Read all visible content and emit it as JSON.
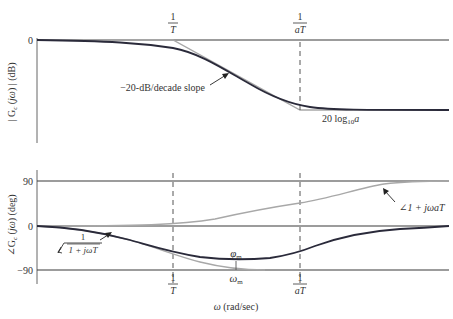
{
  "magnitude_plot": {
    "ylabel": "| G_c (jω) | (dB)",
    "ylabel_parts": {
      "pre": "| G",
      "sub": "c",
      "mid": " (",
      "jw": "jω",
      "post": ") | (dB)"
    },
    "y_tick": "0",
    "annotation_slope": "−20-dB/decade slope",
    "annotation_gain": {
      "pre": "20 log",
      "sub": "10",
      "var": "a"
    }
  },
  "phase_plot": {
    "ylabel": "∠G_c (jω) (deg)",
    "ylabel_parts": {
      "pre": "∠G",
      "sub": "c",
      "mid": " (",
      "jw": "jω",
      "post": ") (deg)"
    },
    "y_ticks": [
      "90",
      "0",
      "−90"
    ],
    "annotation_lead": "∠1 + jωaT",
    "annotation_lag": {
      "angle": "∠",
      "num": "1",
      "den": "1 + jωT"
    },
    "phi_m": {
      "sym": "φ",
      "sub": "m"
    },
    "omega_m": {
      "sym": "ω",
      "sub": "m"
    }
  },
  "breakpoints": {
    "first": {
      "num": "1",
      "den": "T"
    },
    "second": {
      "num": "1",
      "den": "aT"
    }
  },
  "xlabel": {
    "sym": "ω",
    "text": " (rad/sec)"
  },
  "colors": {
    "curve": "#2a2a3a",
    "asymptote": "#a8a8a8",
    "axis": "#555555",
    "gridline": "#3a3a3a"
  }
}
